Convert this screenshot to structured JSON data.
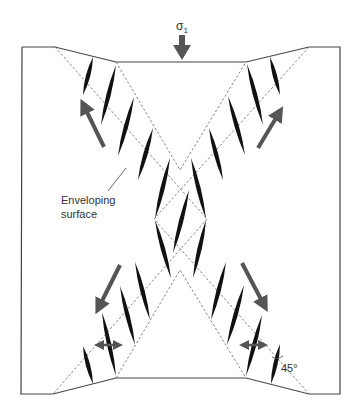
{
  "diagram": {
    "stress_label": "σ",
    "stress_subscript": "1",
    "enveloping_label_line1": "Enveloping",
    "enveloping_label_line2": "surface",
    "angle_label": "45°",
    "colors": {
      "outline": "#444444",
      "dashed": "#777777",
      "vein": "#111111",
      "arrow": "#555555"
    },
    "frame": {
      "outer": [
        [
          22,
          47
        ],
        [
          55,
          47
        ],
        [
          116,
          62
        ],
        [
          246,
          62
        ],
        [
          309,
          47
        ],
        [
          340,
          47
        ],
        [
          340,
          394
        ],
        [
          309,
          394
        ],
        [
          246,
          378
        ],
        [
          116,
          378
        ],
        [
          53,
          394
        ],
        [
          21,
          394
        ],
        [
          22,
          47
        ]
      ]
    },
    "dashed_lines": [
      [
        [
          55,
          47
        ],
        [
          207,
          219
        ],
        [
          53,
          394
        ]
      ],
      [
        [
          116,
          62
        ],
        [
          180,
          170
        ],
        [
          246,
          62
        ]
      ],
      [
        [
          309,
          47
        ],
        [
          154,
          219
        ],
        [
          309,
          394
        ]
      ],
      [
        [
          116,
          378
        ],
        [
          180,
          270
        ],
        [
          246,
          378
        ]
      ]
    ],
    "veins": [
      [
        [
          93,
          57
        ],
        [
          83,
          95
        ]
      ],
      [
        [
          116,
          65
        ],
        [
          101,
          125
        ]
      ],
      [
        [
          134,
          97
        ],
        [
          118,
          156
        ]
      ],
      [
        [
          153,
          128
        ],
        [
          138,
          180
        ]
      ],
      [
        [
          270,
          57
        ],
        [
          280,
          95
        ]
      ],
      [
        [
          247,
          64
        ],
        [
          263,
          125
        ]
      ],
      [
        [
          228,
          96
        ],
        [
          245,
          155
        ]
      ],
      [
        [
          209,
          128
        ],
        [
          223,
          180
        ]
      ],
      [
        [
          170,
          158
        ],
        [
          155,
          219
        ]
      ],
      [
        [
          191,
          158
        ],
        [
          206,
          219
        ]
      ],
      [
        [
          189,
          190
        ],
        [
          173,
          253
        ]
      ],
      [
        [
          155,
          220
        ],
        [
          171,
          278
        ]
      ],
      [
        [
          206,
          220
        ],
        [
          193,
          278
        ]
      ],
      [
        [
          135,
          262
        ],
        [
          150,
          320
        ]
      ],
      [
        [
          120,
          286
        ],
        [
          135,
          345
        ]
      ],
      [
        [
          102,
          312
        ],
        [
          116,
          376
        ]
      ],
      [
        [
          83,
          346
        ],
        [
          93,
          384
        ]
      ],
      [
        [
          226,
          262
        ],
        [
          211,
          320
        ]
      ],
      [
        [
          244,
          285
        ],
        [
          227,
          345
        ]
      ],
      [
        [
          262,
          315
        ],
        [
          246,
          376
        ]
      ],
      [
        [
          280,
          344
        ],
        [
          271,
          384
        ]
      ]
    ],
    "shear_arrows": [
      {
        "from": [
          104,
          147
        ],
        "to": [
          84,
          106
        ]
      },
      {
        "from": [
          258,
          148
        ],
        "to": [
          279,
          113
        ]
      },
      {
        "from": [
          120,
          265
        ],
        "to": [
          99,
          307
        ]
      },
      {
        "from": [
          242,
          263
        ],
        "to": [
          264,
          305
        ]
      }
    ],
    "extension_arrows": [
      {
        "from": [
          94,
          345
        ],
        "to": [
          123,
          345
        ]
      },
      {
        "from": [
          239,
          345
        ],
        "to": [
          268,
          345
        ]
      }
    ],
    "stress_arrow": {
      "from": [
        182,
        35
      ],
      "to": [
        182,
        60
      ]
    },
    "leader_line": {
      "from": [
        126,
        168
      ],
      "to": [
        108,
        191
      ]
    }
  }
}
